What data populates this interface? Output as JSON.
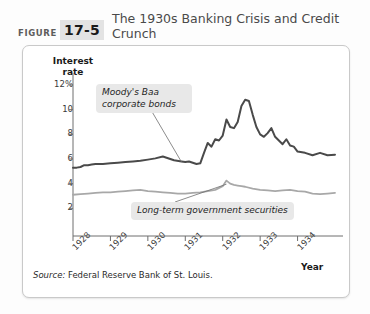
{
  "figure": {
    "label": "FIGURE",
    "number": "17-5",
    "title": "The 1930s Banking Crisis and Credit Crunch"
  },
  "source": {
    "lead": "Source:",
    "text": " Federal Reserve Bank of St. Louis."
  },
  "colors": {
    "baa_line": "#4a4a4a",
    "govt_line": "#a8a8a8",
    "axis": "#6e6e6e",
    "callout_bg": "#e8e8e8",
    "figure_number_bg": "#e3e3e3"
  },
  "chart_data": {
    "type": "line",
    "title": "The 1930s Banking Crisis and Credit Crunch",
    "xlabel": "Year",
    "ylabel": "Interest rate",
    "xlim": [
      1928,
      1935
    ],
    "ylim": [
      0,
      12.8
    ],
    "grid": false,
    "legend": "annotations",
    "yticks": [
      "12%",
      "10",
      "8",
      "6",
      "4",
      "2"
    ],
    "ytick_values": [
      12,
      10,
      8,
      6,
      4,
      2
    ],
    "xticks": [
      "1928",
      "1929",
      "1930",
      "1931",
      "1932",
      "1933",
      "1934"
    ],
    "xtick_values": [
      1928,
      1929,
      1930,
      1931,
      1932,
      1933,
      1934
    ],
    "annotations": [
      {
        "name": "moodys-baa-callout",
        "text": "Moody's Baa\ncorporate bonds",
        "point_x": 1930.9,
        "point_y": 5.75
      },
      {
        "name": "long-term-government-callout",
        "text": "Long-term government securities",
        "point_x": 1932.1,
        "point_y": 4.2
      }
    ],
    "series": [
      {
        "name": "Moody's Baa corporate bonds",
        "color": "#4a4a4a",
        "x": [
          1928.0,
          1928.1,
          1928.2,
          1928.3,
          1928.4,
          1928.5,
          1928.6,
          1928.8,
          1929.0,
          1929.2,
          1929.4,
          1929.6,
          1929.8,
          1930.0,
          1930.2,
          1930.4,
          1930.5,
          1930.7,
          1930.9,
          1931.0,
          1931.1,
          1931.2,
          1931.3,
          1931.4,
          1931.5,
          1931.6,
          1931.7,
          1931.8,
          1931.9,
          1932.0,
          1932.1,
          1932.2,
          1932.3,
          1932.4,
          1932.5,
          1932.6,
          1932.7,
          1932.8,
          1932.9,
          1933.0,
          1933.1,
          1933.2,
          1933.3,
          1933.4,
          1933.5,
          1933.6,
          1933.7,
          1933.8,
          1933.9,
          1934.0,
          1934.2,
          1934.4,
          1934.6,
          1934.8,
          1935.0
        ],
        "y": [
          5.3,
          5.3,
          5.35,
          5.5,
          5.5,
          5.55,
          5.6,
          5.6,
          5.65,
          5.7,
          5.75,
          5.8,
          5.85,
          5.95,
          6.05,
          6.2,
          6.1,
          5.9,
          5.8,
          5.75,
          5.8,
          5.7,
          5.6,
          5.65,
          6.5,
          7.3,
          7.0,
          7.6,
          7.5,
          7.9,
          9.2,
          8.6,
          8.5,
          9.0,
          10.3,
          10.8,
          10.7,
          9.6,
          8.6,
          8.0,
          7.8,
          8.1,
          8.5,
          7.8,
          7.5,
          7.2,
          7.6,
          7.1,
          7.0,
          6.6,
          6.5,
          6.3,
          6.5,
          6.3,
          6.35
        ],
        "units": "percent"
      },
      {
        "name": "Long-term government securities",
        "color": "#a8a8a8",
        "x": [
          1928.0,
          1928.2,
          1928.4,
          1928.6,
          1928.8,
          1929.0,
          1929.2,
          1929.4,
          1929.6,
          1929.8,
          1930.0,
          1930.2,
          1930.4,
          1930.6,
          1930.8,
          1931.0,
          1931.2,
          1931.4,
          1931.6,
          1931.8,
          1932.0,
          1932.1,
          1932.2,
          1932.3,
          1932.4,
          1932.5,
          1932.6,
          1932.8,
          1933.0,
          1933.2,
          1933.4,
          1933.6,
          1933.8,
          1934.0,
          1934.2,
          1934.4,
          1934.6,
          1934.8,
          1935.0
        ],
        "y": [
          3.1,
          3.15,
          3.2,
          3.25,
          3.3,
          3.3,
          3.35,
          3.4,
          3.45,
          3.5,
          3.4,
          3.35,
          3.3,
          3.25,
          3.2,
          3.2,
          3.25,
          3.3,
          3.4,
          3.5,
          3.8,
          4.25,
          4.0,
          3.9,
          3.85,
          3.8,
          3.75,
          3.6,
          3.5,
          3.45,
          3.4,
          3.45,
          3.5,
          3.4,
          3.35,
          3.2,
          3.15,
          3.2,
          3.25
        ],
        "units": "percent"
      }
    ]
  }
}
